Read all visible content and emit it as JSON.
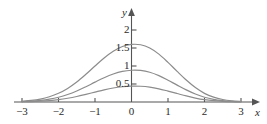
{
  "chart_data": {
    "type": "line",
    "title": "",
    "xlabel": "x",
    "ylabel": "y",
    "xlim": [
      -3.45,
      3.45
    ],
    "ylim": [
      0,
      2.25
    ],
    "grid": false,
    "legend": "none",
    "x_ticks": [
      {
        "value": -3,
        "label": "−3"
      },
      {
        "value": -2,
        "label": "−2"
      },
      {
        "value": -1,
        "label": "−1"
      },
      {
        "value": 0,
        "label": "0"
      },
      {
        "value": 1,
        "label": "1"
      },
      {
        "value": 2,
        "label": "2"
      },
      {
        "value": 3,
        "label": "3"
      }
    ],
    "y_ticks": [
      {
        "value": 0.5,
        "label": "0.5"
      },
      {
        "value": 1,
        "label": "1"
      },
      {
        "value": 1.5,
        "label": "1.5"
      },
      {
        "value": 2,
        "label": "2"
      }
    ],
    "series": [
      {
        "name": "peak-2",
        "color": "#8c8c8c",
        "peak": 2,
        "x": [
          -3.0,
          -2.75,
          -2.5,
          -2.25,
          -2.0,
          -1.75,
          -1.5,
          -1.25,
          -1.0,
          -0.75,
          -0.5,
          -0.25,
          0.0,
          0.25,
          0.5,
          0.75,
          1.0,
          1.25,
          1.5,
          1.75,
          2.0,
          2.25,
          2.5,
          2.75,
          3.0
        ],
        "y": [
          0.022,
          0.044,
          0.082,
          0.145,
          0.241,
          0.377,
          0.555,
          0.769,
          1.0,
          1.223,
          1.41,
          1.54,
          1.6,
          1.59,
          1.5,
          1.33,
          1.1,
          0.85,
          0.61,
          0.4,
          0.24,
          0.135,
          0.07,
          0.034,
          0.016
        ]
      },
      {
        "name": "peak-1",
        "color": "#8c8c8c",
        "peak": 1,
        "x": [
          -3.0,
          -2.75,
          -2.5,
          -2.25,
          -2.0,
          -1.75,
          -1.5,
          -1.25,
          -1.0,
          -0.75,
          -0.5,
          -0.25,
          0.0,
          0.25,
          0.5,
          0.75,
          1.0,
          1.25,
          1.5,
          1.75,
          2.0,
          2.25,
          2.5,
          2.75,
          3.0
        ],
        "y": [
          0.012,
          0.024,
          0.045,
          0.08,
          0.133,
          0.208,
          0.306,
          0.424,
          0.551,
          0.674,
          0.777,
          0.849,
          0.882,
          0.876,
          0.827,
          0.733,
          0.606,
          0.469,
          0.336,
          0.221,
          0.132,
          0.074,
          0.039,
          0.019,
          0.009
        ]
      },
      {
        "name": "peak-0.5",
        "color": "#8c8c8c",
        "peak": 0.5,
        "x": [
          -3.0,
          -2.75,
          -2.5,
          -2.25,
          -2.0,
          -1.75,
          -1.5,
          -1.25,
          -1.0,
          -0.75,
          -0.5,
          -0.25,
          0.0,
          0.25,
          0.5,
          0.75,
          1.0,
          1.25,
          1.5,
          1.75,
          2.0,
          2.25,
          2.5,
          2.75,
          3.0
        ],
        "y": [
          0.006,
          0.012,
          0.023,
          0.04,
          0.066,
          0.104,
          0.153,
          0.212,
          0.275,
          0.337,
          0.389,
          0.424,
          0.441,
          0.438,
          0.414,
          0.367,
          0.303,
          0.235,
          0.168,
          0.11,
          0.066,
          0.037,
          0.019,
          0.009,
          0.004
        ]
      }
    ],
    "axis_color": "#555555",
    "curve_color": "#8c8c8c"
  }
}
